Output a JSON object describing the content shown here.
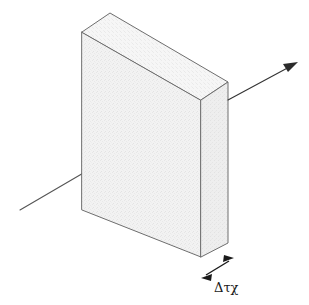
{
  "figure": {
    "kind": "isometric-slab-radiative-transfer-diagram",
    "background_color": "#ffffff",
    "width": 309,
    "height": 305
  },
  "slab": {
    "name": "slab",
    "fill_color": "#f0f0f0",
    "top_face_color": "#f4f4f4",
    "side_face_color": "#eaeaea",
    "stroke_color": "#6e6e6e",
    "stroke_width": 1,
    "front_face_points": "82,32 201,100 201,257 82,210",
    "top_face_points": "82,32 110,13 228,82 201,100",
    "side_face_points": "201,100 228,82 228,243 201,257",
    "texture_opacity": 0.5
  },
  "rays": {
    "incident": {
      "label_name": "incident-ray",
      "path": "M20,210 L145,137",
      "color": "#555555",
      "width": 1.1,
      "has_arrowhead": false
    },
    "emergent": {
      "label_name": "emergent-ray",
      "path": "M228,100 L293,65",
      "color": "#333333",
      "width": 1.1,
      "has_arrowhead": true,
      "arrowhead_points": "298,62 283,64 288,72"
    }
  },
  "dimension": {
    "name": "thickness-dimension",
    "label": "Δτχ",
    "label_x": 214,
    "label_y": 292,
    "line_path": "M206,275 L229,261",
    "color": "#1a1a1a",
    "width": 1.4,
    "arrowhead_start_points": "201,278 212,274 211,281",
    "arrowhead_end_points": "234,258 223,262 224,255"
  }
}
